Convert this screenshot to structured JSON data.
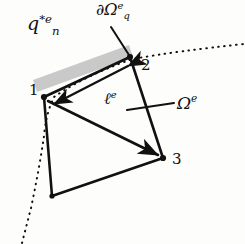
{
  "figure": {
    "background_color": "#fdfdfb",
    "stroke_color": "#111111",
    "shaded_band_color": "#c9c9c9",
    "labels": {
      "flux": {
        "base": "q",
        "sub": "n",
        "sup": "*e",
        "text": "q_n^{*e}"
      },
      "boundary": {
        "base": "∂Ω",
        "sub": "q",
        "sup": "e",
        "text": "∂Ω_q^e"
      },
      "edge_length": {
        "base": "ℓ",
        "sup": "e",
        "text": "ℓ^e"
      },
      "domain": {
        "base": "Ω",
        "sup": "e",
        "text": "Ω^e"
      }
    },
    "nodes": [
      {
        "id": "1",
        "label": "1",
        "x": 44,
        "y": 97
      },
      {
        "id": "2",
        "label": "2",
        "x": 130,
        "y": 57
      },
      {
        "id": "3",
        "label": "3",
        "x": 163,
        "y": 158
      },
      {
        "id": "4",
        "label": "",
        "x": 52,
        "y": 196
      }
    ],
    "element_edges": [
      {
        "from": "1",
        "to": "2"
      },
      {
        "from": "2",
        "to": "3"
      },
      {
        "from": "3",
        "to": "4"
      },
      {
        "from": "4",
        "to": "1"
      }
    ],
    "diagonals": [
      {
        "from": "1",
        "to": "3",
        "arrow": "end"
      },
      {
        "from": "2",
        "to": "1",
        "arrow": "both"
      }
    ],
    "shaded_band": {
      "points": "33,80 129,45 133,57 37,92",
      "description": "gray flux band along edge 1-2"
    },
    "dotted_curve": {
      "description": "global domain boundary passing through nodes 1 and 2",
      "path": "M 22,243 L 32,206 Q 40,168 44,134 Q 46,112 53,96 Q 70,84 96,72 Q 116,63 132,58 Q 176,50 244,43"
    },
    "leader_lines": [
      {
        "name": "boundary-leader",
        "x1": 111,
        "y1": 27,
        "x2": 129,
        "y2": 55
      },
      {
        "name": "domain-leader",
        "x1": 127,
        "y1": 110,
        "x2": 174,
        "y2": 103
      }
    ]
  }
}
